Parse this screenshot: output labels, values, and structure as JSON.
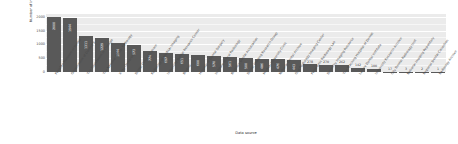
{
  "chart_data": {
    "type": "bar",
    "title": "",
    "subtitle": "",
    "xlabel": "Data source",
    "ylabel": "Number of images",
    "ylim": [
      0,
      2100
    ],
    "yticks": [
      0,
      500,
      1000,
      1500,
      2000
    ],
    "grid": true,
    "legend": "none",
    "orientation": "vertical",
    "bar_color": "#595959",
    "panel_color": "#ebebeb",
    "grid_color": "#ffffff",
    "value_label_color": "#ffffff",
    "categories": [
      "Pakistan Museum of Dental",
      "Government of Dentistry",
      "The Foundation of Chicago",
      "The National Dental Radiology",
      "X-ray University",
      "Dental Clinic of Lahore",
      "Radiology of Medical Imaging",
      "University Dental Research Center",
      "Brazilia",
      "Hospital of Dental Surgery",
      "Institute of Oral Radiology",
      "Brazilian Dental Association",
      "Dental Imaging Research Group",
      "Medical University Clinic",
      "National Dental Archive",
      "Oral Radiology Imaging Center",
      "Panoramic Radiology Lab",
      "Dentistry Imaging Resource",
      "The Teaching Hospital of Dental",
      "Lahore Dental Institute",
      "University Research Archive",
      "City Dental Radiology Unit",
      "National Imaging Repository",
      "Regional Dental Collection",
      "Radiology Archive"
    ],
    "values": [
      2000,
      1944,
      1311,
      1229,
      1044,
      973,
      774,
      697,
      651,
      600,
      570,
      561,
      500,
      486,
      476,
      443,
      278,
      270,
      262,
      142,
      100,
      17,
      3,
      2,
      1
    ],
    "value_labels": [
      "2000",
      "1944",
      "1311",
      "1229",
      "1044",
      "973",
      "774",
      "697",
      "651",
      "600",
      "570",
      "561",
      "500",
      "486",
      "476",
      "443",
      "278",
      "270",
      "262",
      "142",
      "100",
      "17",
      "3",
      "2",
      "1"
    ]
  }
}
